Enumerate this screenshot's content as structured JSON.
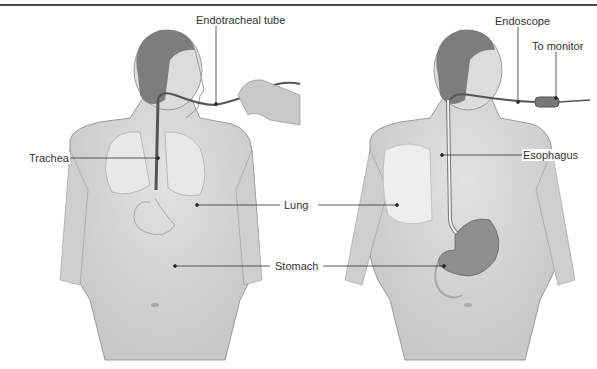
{
  "figure": {
    "left_panel": {
      "title": "Endotracheal intubation",
      "labels": {
        "endotracheal_tube": "Endotracheal tube",
        "trachea": "Trachea"
      }
    },
    "right_panel": {
      "title": "Endoscopy",
      "labels": {
        "endoscope": "Endoscope",
        "to_monitor": "To monitor",
        "esophagus": "Esophagus"
      }
    },
    "shared_labels": {
      "lung": "Lung",
      "stomach": "Stomach"
    }
  },
  "colors": {
    "skin": "#d9d9d9",
    "skin_shadow": "#c4c4c4",
    "hair": "#7d7d7d",
    "line": "#444444",
    "lung": "#e6e6e6",
    "stomach_inner": "#8f8f8f"
  }
}
